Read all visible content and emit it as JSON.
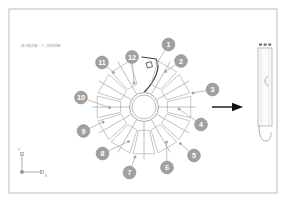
{
  "sheet": {
    "title_note": "- 部分拡大図 ・リブ形状詳細",
    "frame": {
      "x": 9,
      "y": 9,
      "width": 268,
      "height": 184,
      "color": "#b4b4b4"
    },
    "background": "#ffffff"
  },
  "colors": {
    "line": "#a8a8a8",
    "line_dark": "#3c3c3c",
    "balloon_fill": "#a0a0a0",
    "balloon_text": "#ffffff",
    "arrow": "#101010",
    "frame": "#b4b4b4",
    "axis": "#8c8c8c"
  },
  "main_view": {
    "name": "rosette-assembly",
    "hub": {
      "cx": 144,
      "cy": 107,
      "outer_r": 14.5,
      "inner_r": 12.0
    },
    "petal_count": 12,
    "highlighted_petal_index": 1,
    "spokes": [
      {
        "index": 1,
        "angle_deg": 90
      },
      {
        "index": 2,
        "angle_deg": 60
      },
      {
        "index": 3,
        "angle_deg": 30
      },
      {
        "index": 4,
        "angle_deg": 0
      },
      {
        "index": 5,
        "angle_deg": -30
      },
      {
        "index": 6,
        "angle_deg": -60
      },
      {
        "index": 7,
        "angle_deg": -90
      },
      {
        "index": 8,
        "angle_deg": -120
      },
      {
        "index": 9,
        "angle_deg": -150
      },
      {
        "index": 10,
        "angle_deg": 180
      },
      {
        "index": 11,
        "angle_deg": 150
      },
      {
        "index": 12,
        "angle_deg": 120
      }
    ]
  },
  "balloons": [
    {
      "label": "1",
      "cx": 168.5,
      "cy": 44.5,
      "r": 6.4,
      "anchor_x": 157.0,
      "anchor_y": 63.0
    },
    {
      "label": "2",
      "cx": 181.0,
      "cy": 61.0,
      "r": 6.4,
      "anchor_x": 165.5,
      "anchor_y": 71.5
    },
    {
      "label": "3",
      "cx": 212.5,
      "cy": 89.5,
      "r": 6.4,
      "anchor_x": 193.0,
      "anchor_y": 93.0
    },
    {
      "label": "4",
      "cx": 201.0,
      "cy": 124.5,
      "r": 6.4,
      "anchor_x": 179.0,
      "anchor_y": 109.0
    },
    {
      "label": "5",
      "cx": 194.0,
      "cy": 155.5,
      "r": 6.4,
      "anchor_x": 180.5,
      "anchor_y": 143.5
    },
    {
      "label": "6",
      "cx": 167.0,
      "cy": 167.5,
      "r": 6.4,
      "anchor_x": 166.5,
      "anchor_y": 142.0
    },
    {
      "label": "7",
      "cx": 129.5,
      "cy": 172.5,
      "r": 6.4,
      "anchor_x": 135.0,
      "anchor_y": 157.0
    },
    {
      "label": "8",
      "cx": 102.5,
      "cy": 153.5,
      "r": 6.4,
      "anchor_x": 128.5,
      "anchor_y": 141.5
    },
    {
      "label": "9",
      "cx": 83.5,
      "cy": 131.0,
      "r": 6.4,
      "anchor_x": 103.0,
      "anchor_y": 122.0
    },
    {
      "label": "10",
      "cx": 81.0,
      "cy": 97.5,
      "r": 6.4,
      "anchor_x": 109.5,
      "anchor_y": 107.5
    },
    {
      "label": "11",
      "cx": 102.0,
      "cy": 62.5,
      "r": 6.4,
      "anchor_x": 113.5,
      "anchor_y": 72.5
    },
    {
      "label": "12",
      "cx": 132.0,
      "cy": 57.0,
      "r": 6.4,
      "anchor_x": 134.0,
      "anchor_y": 83.0
    }
  ],
  "transform_arrow": {
    "name": "section-direction-arrow",
    "x1": 212,
    "y1": 107,
    "x2": 243,
    "y2": 107
  },
  "detail_view": {
    "name": "rib-section-detail",
    "x": 258,
    "y": 48,
    "width": 14,
    "height": 78,
    "tick_marks": 3
  },
  "axis_indicator": {
    "name": "coordinate-axis-triad",
    "origin_x": 22,
    "origin_y": 172,
    "y_label": "Y",
    "x_label": "X",
    "y_len": 18,
    "x_len": 20
  }
}
